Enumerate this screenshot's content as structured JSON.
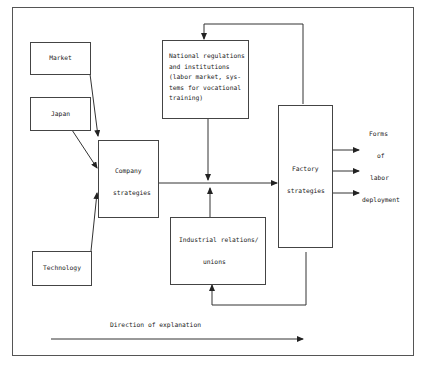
{
  "diagram": {
    "nodes": {
      "market": "Market",
      "japan": "Japan",
      "technology": "Technology",
      "company_1": "Company",
      "company_2": "strategies",
      "national_1": "National regulations",
      "national_2": "and institutions",
      "national_3": "(labor market, sys-",
      "national_4": "tems for vocational",
      "national_5": "training)",
      "industrial_1": "Industrial relations/",
      "industrial_2": "unions",
      "factory_1": "Factory",
      "factory_2": "strategies"
    },
    "outputs": {
      "l1": "Forms",
      "l2": "of",
      "l3": "labor",
      "l4": "deployment"
    },
    "direction_label": "Direction of explanation"
  }
}
